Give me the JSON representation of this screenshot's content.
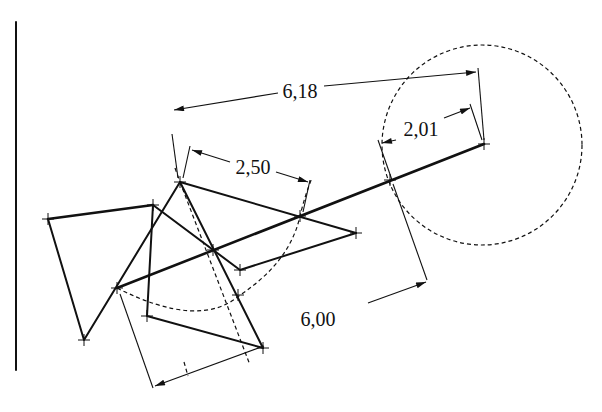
{
  "diagram": {
    "type": "geometric-construction",
    "dimensions": [
      {
        "id": "dim-618",
        "label": "6,18"
      },
      {
        "id": "dim-250",
        "label": "2,50"
      },
      {
        "id": "dim-201",
        "label": "2,01"
      },
      {
        "id": "dim-600",
        "label": "6,00"
      }
    ],
    "circle": {
      "cx": 482,
      "cy": 145,
      "r": 100,
      "style": "dashed"
    },
    "arc": {
      "style": "dashed",
      "center": "F"
    },
    "main_axis": {
      "from": "E",
      "to": "M",
      "style": "thick"
    },
    "colors": {
      "ink": "#111111",
      "background": "#ffffff"
    }
  }
}
